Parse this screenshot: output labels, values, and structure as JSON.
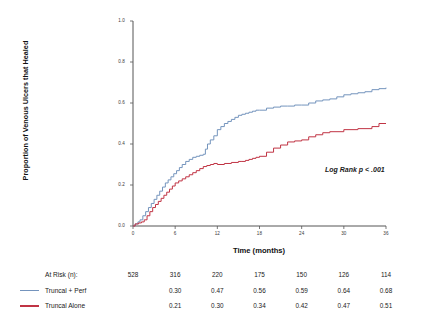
{
  "chart_data": {
    "type": "line",
    "title": "",
    "xlabel": "Time (months)",
    "ylabel": "Proportion of Venous Ulcers that Healed",
    "xlim": [
      0,
      36
    ],
    "ylim": [
      0.0,
      1.0
    ],
    "xticks": [
      "0",
      "6",
      "12",
      "18",
      "24",
      "30",
      "36"
    ],
    "xtick_values": [
      0,
      6,
      12,
      18,
      24,
      30,
      36
    ],
    "yticks": [
      "1.0",
      "0.8",
      "0.6",
      "0.4",
      "0.2",
      "0.0"
    ],
    "ytick_values": [
      1.0,
      0.8,
      0.6,
      0.4,
      0.2,
      0.0
    ],
    "grid": false,
    "legend_position": "below-axis-table",
    "annotation": "Log Rank p < .001",
    "series": [
      {
        "name": "Truncal + Perf",
        "color": "#7494bd",
        "x": [
          0,
          0.3,
          0.7,
          1.0,
          1.4,
          1.8,
          2.2,
          2.6,
          3.0,
          3.4,
          3.8,
          4.2,
          4.6,
          5.0,
          5.4,
          5.8,
          6.2,
          6.6,
          7.0,
          7.5,
          8.0,
          8.5,
          9.0,
          9.5,
          10.0,
          10.3,
          10.6,
          11.0,
          11.5,
          12.0,
          12.5,
          13.0,
          13.5,
          14.0,
          14.5,
          15.0,
          15.5,
          16.0,
          16.5,
          17.0,
          17.5,
          18.0,
          19.0,
          20.0,
          21.0,
          22.0,
          23.0,
          24.0,
          25.0,
          26.0,
          27.0,
          28.0,
          29.0,
          30.0,
          31.0,
          32.0,
          33.0,
          34.0,
          35.0,
          36.0
        ],
        "y": [
          0.0,
          0.01,
          0.02,
          0.03,
          0.05,
          0.07,
          0.09,
          0.11,
          0.13,
          0.15,
          0.17,
          0.19,
          0.21,
          0.225,
          0.24,
          0.255,
          0.27,
          0.285,
          0.3,
          0.315,
          0.325,
          0.335,
          0.34,
          0.345,
          0.35,
          0.375,
          0.4,
          0.42,
          0.44,
          0.47,
          0.485,
          0.5,
          0.51,
          0.52,
          0.53,
          0.54,
          0.545,
          0.55,
          0.555,
          0.56,
          0.565,
          0.565,
          0.575,
          0.58,
          0.585,
          0.585,
          0.59,
          0.59,
          0.6,
          0.61,
          0.615,
          0.62,
          0.63,
          0.64,
          0.645,
          0.65,
          0.655,
          0.665,
          0.67,
          0.675
        ]
      },
      {
        "name": "Truncal Alone",
        "color": "#c03444",
        "x": [
          0,
          0.3,
          0.8,
          1.2,
          1.6,
          2.0,
          2.4,
          2.8,
          3.2,
          3.6,
          4.0,
          4.4,
          4.8,
          5.2,
          5.6,
          6.0,
          6.5,
          7.0,
          7.5,
          8.0,
          8.5,
          9.0,
          9.5,
          10.0,
          10.5,
          11.0,
          11.5,
          12.0,
          13.0,
          14.0,
          15.0,
          15.5,
          16.0,
          16.5,
          17.0,
          17.5,
          18.0,
          19.0,
          20.0,
          21.0,
          22.0,
          23.0,
          24.0,
          25.0,
          26.0,
          27.0,
          28.0,
          30.0,
          32.0,
          34.0,
          35.0,
          36.0
        ],
        "y": [
          0.0,
          0.01,
          0.015,
          0.02,
          0.03,
          0.05,
          0.07,
          0.09,
          0.105,
          0.12,
          0.135,
          0.15,
          0.165,
          0.18,
          0.195,
          0.21,
          0.22,
          0.23,
          0.24,
          0.25,
          0.26,
          0.27,
          0.28,
          0.29,
          0.295,
          0.3,
          0.305,
          0.3,
          0.305,
          0.31,
          0.315,
          0.315,
          0.32,
          0.325,
          0.33,
          0.335,
          0.34,
          0.36,
          0.38,
          0.395,
          0.41,
          0.415,
          0.42,
          0.435,
          0.445,
          0.455,
          0.46,
          0.47,
          0.475,
          0.485,
          0.5,
          0.5
        ]
      }
    ]
  },
  "risk_table": {
    "rows": [
      {
        "label": "At Risk (n):",
        "swatch_color": null,
        "values": [
          "528",
          "316",
          "220",
          "175",
          "150",
          "126",
          "114"
        ]
      },
      {
        "label": "Truncal + Perf",
        "swatch_color": "#7494bd",
        "values": [
          "",
          "0.30",
          "0.47",
          "0.56",
          "0.59",
          "0.64",
          "0.68"
        ]
      },
      {
        "label": "Truncal Alone",
        "swatch_color": "#c03444",
        "values": [
          "",
          "0.21",
          "0.30",
          "0.34",
          "0.42",
          "0.47",
          "0.51"
        ]
      }
    ]
  },
  "axes": {
    "axis_color": "#555555",
    "background": "#ffffff"
  }
}
